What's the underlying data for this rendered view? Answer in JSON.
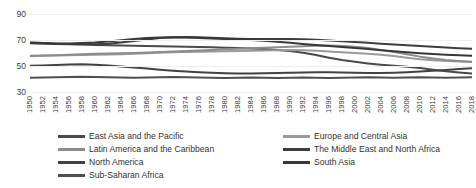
{
  "chart_data": {
    "type": "line",
    "title": "",
    "xlabel": "",
    "ylabel": "",
    "ylim": [
      30,
      90
    ],
    "yticks": [
      30,
      50,
      70,
      90
    ],
    "grid": true,
    "legend_position": "bottom",
    "x": [
      1950,
      1952,
      1954,
      1956,
      1958,
      1960,
      1962,
      1964,
      1966,
      1968,
      1970,
      1972,
      1974,
      1976,
      1978,
      1980,
      1982,
      1984,
      1986,
      1988,
      1990,
      1992,
      1994,
      1996,
      1998,
      2000,
      2002,
      2004,
      2006,
      2008,
      2010,
      2012,
      2014,
      2016,
      2018
    ],
    "xtick_labels": [
      "1950",
      "1952",
      "1954",
      "1956",
      "1958",
      "1960",
      "1962",
      "1964",
      "1966",
      "1968",
      "1970",
      "1972",
      "1974",
      "1976",
      "1978",
      "1980",
      "1982",
      "1984",
      "1986",
      "1988",
      "1990",
      "1992",
      "1994",
      "1996",
      "1998",
      "2000",
      "2002",
      "2004",
      "2006",
      "2008",
      "2010",
      "2012",
      "2014",
      "2016",
      "2018"
    ],
    "series": [
      {
        "name": "East Asia and the Pacific",
        "color": "#4a4a4a",
        "values": [
          67.5,
          67.2,
          67.0,
          66.8,
          66.5,
          66.2,
          66.0,
          65.8,
          65.6,
          65.4,
          65.2,
          65.0,
          64.8,
          64.6,
          64.4,
          64.1,
          63.8,
          63.4,
          63.0,
          62.4,
          61.6,
          60.2,
          58.4,
          56.4,
          54.6,
          53.2,
          52.0,
          51.0,
          50.2,
          49.4,
          48.4,
          47.2,
          46.0,
          45.0,
          44.2
        ]
      },
      {
        "name": "Europe and Central Asia",
        "color": "#9a9a9a",
        "values": [
          57.5,
          57.8,
          58.0,
          58.2,
          58.4,
          58.6,
          58.8,
          59.0,
          59.4,
          59.8,
          60.2,
          60.6,
          60.8,
          61.0,
          61.2,
          61.4,
          61.6,
          61.8,
          62.0,
          62.2,
          62.4,
          62.2,
          61.8,
          61.2,
          60.6,
          60.0,
          59.4,
          58.6,
          57.6,
          56.4,
          55.2,
          54.4,
          53.8,
          53.4,
          53.0
        ]
      },
      {
        "name": "Latin America and the Caribbean",
        "color": "#8c8c8c",
        "values": [
          57.8,
          58.0,
          58.2,
          58.6,
          59.0,
          59.4,
          59.6,
          59.8,
          60.0,
          60.4,
          60.8,
          61.2,
          61.6,
          62.0,
          62.4,
          62.8,
          63.2,
          63.6,
          64.0,
          64.4,
          64.8,
          65.2,
          65.6,
          65.8,
          65.4,
          64.8,
          63.8,
          62.4,
          60.8,
          59.0,
          57.2,
          55.8,
          54.6,
          53.8,
          53.2
        ]
      },
      {
        "name": "The Middle East and North Africa",
        "color": "#3d3d3d",
        "values": [
          68.0,
          67.6,
          67.2,
          67.0,
          66.8,
          66.8,
          67.2,
          68.0,
          69.2,
          70.4,
          71.6,
          72.2,
          72.4,
          72.2,
          71.8,
          71.4,
          71.0,
          70.8,
          70.8,
          70.8,
          70.8,
          70.6,
          70.2,
          69.6,
          69.0,
          68.4,
          67.8,
          67.2,
          66.6,
          66.0,
          65.4,
          64.8,
          64.2,
          63.6,
          63.2
        ]
      },
      {
        "name": "North America",
        "color": "#424242",
        "values": [
          50.2,
          50.4,
          50.8,
          51.2,
          51.4,
          51.0,
          50.4,
          49.6,
          48.8,
          48.0,
          47.2,
          46.4,
          45.8,
          45.2,
          44.8,
          44.4,
          44.2,
          44.2,
          44.4,
          44.6,
          44.8,
          45.0,
          45.2,
          45.2,
          45.0,
          44.8,
          44.6,
          44.6,
          44.8,
          45.2,
          45.8,
          46.4,
          47.0,
          47.6,
          48.2
        ]
      },
      {
        "name": "South Asia",
        "color": "#383838",
        "values": [
          67.8,
          67.6,
          67.4,
          67.4,
          67.6,
          68.0,
          68.8,
          69.8,
          70.8,
          71.6,
          72.0,
          72.2,
          72.0,
          71.6,
          71.2,
          70.8,
          70.4,
          70.0,
          69.4,
          68.6,
          67.8,
          67.0,
          66.2,
          65.4,
          64.6,
          63.8,
          63.0,
          62.2,
          61.4,
          60.6,
          59.8,
          59.2,
          58.6,
          58.2,
          57.8
        ]
      },
      {
        "name": "Sub-Saharan Africa",
        "color": "#4f4f4f",
        "values": [
          41.0,
          41.2,
          41.4,
          41.6,
          41.8,
          41.6,
          41.4,
          41.2,
          41.0,
          41.2,
          41.4,
          41.6,
          41.4,
          41.2,
          41.0,
          40.8,
          41.0,
          41.2,
          41.0,
          40.8,
          41.0,
          41.2,
          41.0,
          40.8,
          41.0,
          41.2,
          41.4,
          41.2,
          41.0,
          41.2,
          41.4,
          41.2,
          41.0,
          41.2,
          41.4
        ]
      }
    ]
  },
  "legend": {
    "left_column": [
      {
        "label": "East Asia and the Pacific",
        "color": "#4a4a4a"
      },
      {
        "label": "Latin America and the Caribbean",
        "color": "#8c8c8c"
      },
      {
        "label": "North America",
        "color": "#424242"
      },
      {
        "label": "Sub-Saharan Africa",
        "color": "#4f4f4f"
      }
    ],
    "right_column": [
      {
        "label": "Europe and Central Asia",
        "color": "#9a9a9a"
      },
      {
        "label": "The Middle East and North Africa",
        "color": "#3d3d3d"
      },
      {
        "label": "South Asia",
        "color": "#383838"
      }
    ]
  }
}
